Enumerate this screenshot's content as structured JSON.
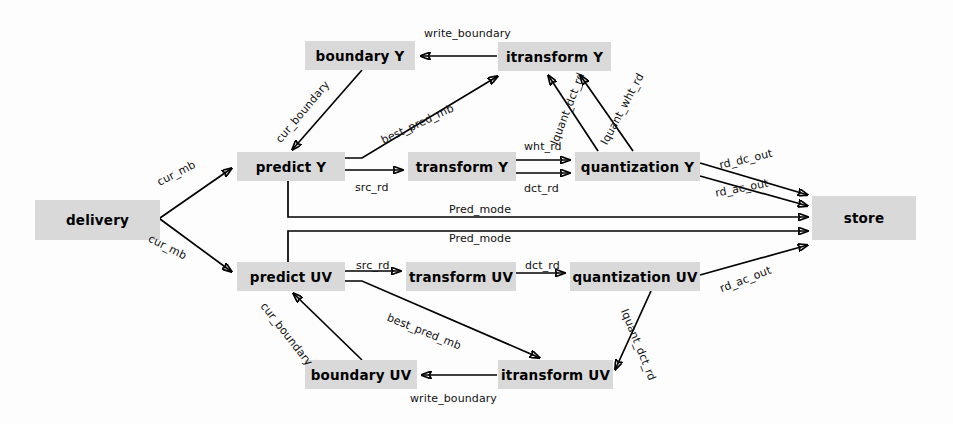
{
  "diagram": {
    "style": {
      "node_fill": "#d9d9d9",
      "node_text": "#000000",
      "edge_color": "#000000",
      "background": "#fdfdfd"
    },
    "nodes": [
      {
        "id": "delivery",
        "label": "delivery",
        "x": 35,
        "y": 200,
        "w": 125,
        "h": 40
      },
      {
        "id": "boundary_y",
        "label": "boundary Y",
        "x": 305,
        "y": 41,
        "w": 110,
        "h": 29
      },
      {
        "id": "itransform_y",
        "label": "itransform  Y",
        "x": 498,
        "y": 42,
        "w": 113,
        "h": 29
      },
      {
        "id": "predict_y",
        "label": "predict Y",
        "x": 237,
        "y": 152,
        "w": 108,
        "h": 29
      },
      {
        "id": "transform_y",
        "label": "transform  Y",
        "x": 408,
        "y": 152,
        "w": 108,
        "h": 29
      },
      {
        "id": "quantization_y",
        "label": "quantization  Y",
        "x": 575,
        "y": 152,
        "w": 125,
        "h": 29
      },
      {
        "id": "store",
        "label": "store",
        "x": 812,
        "y": 196,
        "w": 104,
        "h": 44
      },
      {
        "id": "predict_uv",
        "label": "predict UV",
        "x": 237,
        "y": 262,
        "w": 108,
        "h": 29
      },
      {
        "id": "transform_uv",
        "label": "transform  UV",
        "x": 406,
        "y": 262,
        "w": 110,
        "h": 29
      },
      {
        "id": "quantization_uv",
        "label": "quantization  UV",
        "x": 570,
        "y": 262,
        "w": 130,
        "h": 29
      },
      {
        "id": "boundary_uv",
        "label": "boundary UV",
        "x": 305,
        "y": 360,
        "w": 112,
        "h": 29
      },
      {
        "id": "itransform_uv",
        "label": "itransform  UV",
        "x": 498,
        "y": 360,
        "w": 115,
        "h": 29
      }
    ],
    "edges": [
      {
        "id": "e1",
        "from": "delivery",
        "to": "predict_y",
        "label": "cur_mb"
      },
      {
        "id": "e2",
        "from": "delivery",
        "to": "predict_uv",
        "label": "cur_mb"
      },
      {
        "id": "e3",
        "from": "boundary_y",
        "to": "predict_y",
        "label": "cur_boundary"
      },
      {
        "id": "e4",
        "from": "predict_y",
        "to": "itransform_y",
        "label": "best_pred_mb"
      },
      {
        "id": "e5",
        "from": "predict_y",
        "to": "transform_y",
        "label": "src_rd"
      },
      {
        "id": "e6",
        "from": "transform_y",
        "to": "quantization_y",
        "label": "wht_rd"
      },
      {
        "id": "e7",
        "from": "transform_y",
        "to": "quantization_y",
        "label": "dct_rd"
      },
      {
        "id": "e8",
        "from": "quantization_y",
        "to": "itransform_y",
        "label": "Iquant_dct_rd"
      },
      {
        "id": "e9",
        "from": "quantization_y",
        "to": "itransform_y",
        "label": "Iquant_wht_rd"
      },
      {
        "id": "e10",
        "from": "itransform_y",
        "to": "boundary_y",
        "label": "write_boundary"
      },
      {
        "id": "e11",
        "from": "quantization_y",
        "to": "store",
        "label": "rd_dc_out"
      },
      {
        "id": "e12",
        "from": "quantization_y",
        "to": "store",
        "label": "rd_ac_out"
      },
      {
        "id": "e13",
        "from": "predict_y",
        "to": "store",
        "label": "Pred_mode"
      },
      {
        "id": "e14",
        "from": "predict_uv",
        "to": "store",
        "label": "Pred_mode"
      },
      {
        "id": "e15",
        "from": "predict_uv",
        "to": "transform_uv",
        "label": "src_rd"
      },
      {
        "id": "e16",
        "from": "transform_uv",
        "to": "quantization_uv",
        "label": "dct_rd"
      },
      {
        "id": "e17",
        "from": "quantization_uv",
        "to": "store",
        "label": "rd_ac_out"
      },
      {
        "id": "e18",
        "from": "quantization_uv",
        "to": "itransform_uv",
        "label": "Iquant_dct_rd"
      },
      {
        "id": "e19",
        "from": "predict_uv",
        "to": "itransform_uv",
        "label": "best_pred_mb"
      },
      {
        "id": "e20",
        "from": "itransform_uv",
        "to": "boundary_uv",
        "label": "write_boundary"
      },
      {
        "id": "e21",
        "from": "boundary_uv",
        "to": "predict_uv",
        "label": "cur_boundary"
      }
    ],
    "labels": {
      "cur_mb_top": {
        "text": "cur_mb",
        "x": 155,
        "y": 177,
        "rot": -27
      },
      "cur_mb_bottom": {
        "text": "cur_mb",
        "x": 152,
        "y": 232,
        "rot": 27
      },
      "cur_boundary_y": {
        "text": "cur_boundary",
        "x": 273,
        "y": 137,
        "rot": -50
      },
      "best_pred_mb_y": {
        "text": "best_pred_mb",
        "x": 379,
        "y": 135,
        "rot": -25
      },
      "src_rd_y": {
        "text": "src_rd",
        "x": 355,
        "y": 181,
        "rot": 0
      },
      "wht_rd": {
        "text": "wht_rd",
        "x": 524,
        "y": 140,
        "rot": 0
      },
      "dct_rd_y": {
        "text": "dct_rd",
        "x": 524,
        "y": 182,
        "rot": 0
      },
      "iquant_dct_rd_y": {
        "text": "Iquant_dct_rd",
        "x": 548,
        "y": 142,
        "rot": -69
      },
      "iquant_wht_rd_y": {
        "text": "Iquant_wht_rd",
        "x": 598,
        "y": 141,
        "rot": -62
      },
      "write_boundary_y": {
        "text": "write_boundary",
        "x": 424,
        "y": 27,
        "rot": 0
      },
      "rd_dc_out": {
        "text": "rd_dc_out",
        "x": 718,
        "y": 159,
        "rot": -13
      },
      "rd_ac_out_y": {
        "text": "rd_ac_out",
        "x": 714,
        "y": 187,
        "rot": -11
      },
      "pred_mode_top": {
        "text": "Pred_mode",
        "x": 449,
        "y": 203,
        "rot": 0
      },
      "pred_mode_bottom": {
        "text": "Pred_mode",
        "x": 449,
        "y": 232,
        "rot": 0
      },
      "src_rd_uv": {
        "text": "src_rd",
        "x": 356,
        "y": 259,
        "rot": 0
      },
      "dct_rd_uv": {
        "text": "dct_rd",
        "x": 525,
        "y": 259,
        "rot": 0
      },
      "rd_ac_out_uv": {
        "text": "rd_ac_out",
        "x": 718,
        "y": 283,
        "rot": -21
      },
      "iquant_dct_rd_uv": {
        "text": "Iquant_dct_rd",
        "x": 630,
        "y": 307,
        "rot": 68
      },
      "best_pred_mb_uv": {
        "text": "best_pred_mb",
        "x": 390,
        "y": 311,
        "rot": 22
      },
      "cur_boundary_uv": {
        "text": "cur_boundary",
        "x": 268,
        "y": 300,
        "rot": 52
      },
      "write_boundary_uv": {
        "text": "write_boundary",
        "x": 410,
        "y": 392,
        "rot": 0
      }
    }
  }
}
